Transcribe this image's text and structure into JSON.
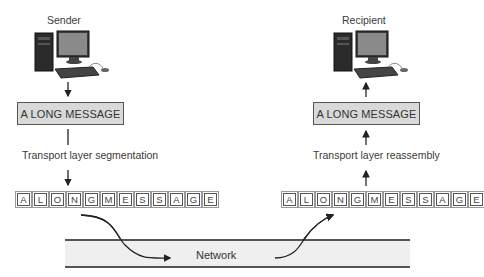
{
  "sender": {
    "label": "Sender",
    "message": "A LONG MESSAGE",
    "process": "Transport layer segmentation",
    "segments": [
      "A",
      "L",
      "O",
      "N",
      "G",
      "M",
      "E",
      "S",
      "S",
      "A",
      "G",
      "E"
    ]
  },
  "recipient": {
    "label": "Recipient",
    "message": "A LONG MESSAGE",
    "process": "Transport layer reassembly",
    "segments": [
      "A",
      "L",
      "O",
      "N",
      "G",
      "M",
      "E",
      "S",
      "S",
      "A",
      "G",
      "E"
    ]
  },
  "network": {
    "label": "Network"
  }
}
